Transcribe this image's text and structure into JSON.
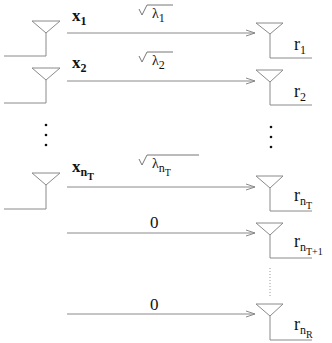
{
  "diagram": {
    "colors": {
      "lines": "#8a8a8a",
      "text": "#111111"
    },
    "transmit": [
      {
        "base": "x",
        "sub": "1",
        "subsub": ""
      },
      {
        "base": "x",
        "sub": "2",
        "subsub": ""
      },
      {
        "base": "x",
        "sub": "n",
        "subsub": "T"
      }
    ],
    "gains": [
      {
        "sym": "λ",
        "sub": "1",
        "subsub": ""
      },
      {
        "sym": "λ",
        "sub": "2",
        "subsub": ""
      },
      {
        "sym": "λ",
        "sub": "n",
        "subsub": "T"
      },
      {
        "value": "0"
      },
      {
        "value": "0"
      }
    ],
    "receive": [
      {
        "base": "r",
        "sub": "1",
        "subsub": ""
      },
      {
        "base": "r",
        "sub": "2",
        "subsub": ""
      },
      {
        "base": "r",
        "sub": "n",
        "subsub": "T"
      },
      {
        "base": "r",
        "sub": "n",
        "subsub": "T+1"
      },
      {
        "base": "r",
        "sub": "n",
        "subsub": "R"
      }
    ],
    "ellipsis": "⋮"
  }
}
